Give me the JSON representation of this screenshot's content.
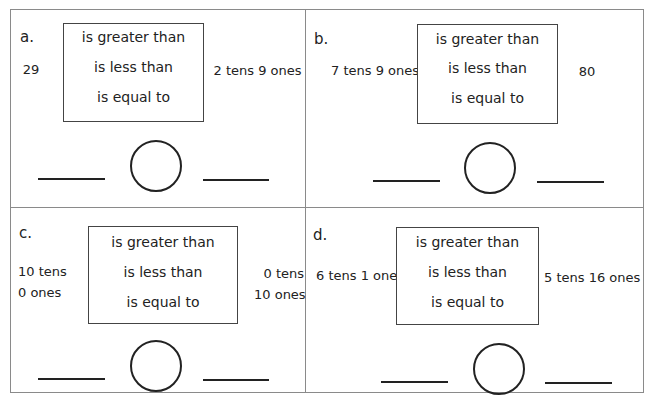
{
  "worksheet": {
    "options": [
      "is greater than",
      "is less than",
      "is equal to"
    ],
    "problems": [
      {
        "label": "a.",
        "left": [
          "29"
        ],
        "right": [
          "2 tens 9 ones"
        ]
      },
      {
        "label": "b.",
        "left": [
          "7 tens 9 ones"
        ],
        "right": [
          "80"
        ]
      },
      {
        "label": "c.",
        "left": [
          "10 tens",
          "0 ones"
        ],
        "right": [
          "0 tens",
          "10 ones"
        ]
      },
      {
        "label": "d.",
        "left": [
          "6 tens 1 one"
        ],
        "right": [
          "5 tens 16 ones"
        ]
      }
    ]
  }
}
